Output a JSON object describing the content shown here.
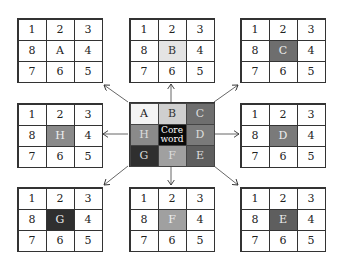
{
  "grids": [
    {
      "id": "A",
      "center_fill": "#ffffff",
      "center_text_color": "#222222",
      "cells": [
        "1",
        "2",
        "3",
        "8",
        "A",
        "4",
        "7",
        "6",
        "5"
      ]
    },
    {
      "id": "B",
      "center_fill": "#e4e4e4",
      "center_text_color": "#333333",
      "cells": [
        "1",
        "2",
        "3",
        "8",
        "B",
        "4",
        "7",
        "6",
        "5"
      ]
    },
    {
      "id": "C",
      "center_fill": "#6e6e6e",
      "center_text_color": "#eeeeee",
      "cells": [
        "1",
        "2",
        "3",
        "8",
        "C",
        "4",
        "7",
        "6",
        "5"
      ]
    },
    {
      "id": "H",
      "center_fill": "#8a8a8a",
      "center_text_color": "#eeeeee",
      "cells": [
        "1",
        "2",
        "3",
        "8",
        "H",
        "4",
        "7",
        "6",
        "5"
      ]
    },
    {
      "id": "D",
      "center_fill": "#7a7a7a",
      "center_text_color": "#eeeeee",
      "cells": [
        "1",
        "2",
        "3",
        "8",
        "D",
        "4",
        "7",
        "6",
        "5"
      ]
    },
    {
      "id": "G",
      "center_fill": "#2f2f2f",
      "center_text_color": "#eeeeee",
      "cells": [
        "1",
        "2",
        "3",
        "8",
        "G",
        "4",
        "7",
        "6",
        "5"
      ]
    },
    {
      "id": "F",
      "center_fill": "#a0a0a0",
      "center_text_color": "#eeeeee",
      "cells": [
        "1",
        "2",
        "3",
        "8",
        "F",
        "4",
        "7",
        "6",
        "5"
      ]
    },
    {
      "id": "E",
      "center_fill": "#5e5e5e",
      "center_text_color": "#eeeeee",
      "cells": [
        "1",
        "2",
        "3",
        "8",
        "E",
        "4",
        "7",
        "6",
        "5"
      ]
    }
  ],
  "core": {
    "cells": [
      "A",
      "B",
      "C",
      "H",
      "Core word",
      "D",
      "G",
      "F",
      "E"
    ],
    "fills": [
      "#f4f4f4",
      "#cfcfcf",
      "#6e6e6e",
      "#8a8a8a",
      "#0a0a0a",
      "#7a7a7a",
      "#2f2f2f",
      "#a0a0a0",
      "#5e5e5e"
    ],
    "text_colors": [
      "#222222",
      "#333333",
      "#dddddd",
      "#dddddd",
      "#ffffff",
      "#dddddd",
      "#dddddd",
      "#dddddd",
      "#dddddd"
    ]
  }
}
